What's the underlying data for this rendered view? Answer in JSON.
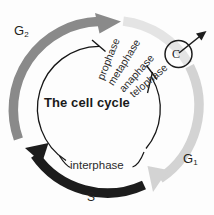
{
  "figure": {
    "title": "The cell cycle",
    "background_color": "#fdfdfd"
  },
  "center": {
    "title": "The cell cycle"
  },
  "phases": {
    "g2": {
      "label": "G",
      "subscript": "2",
      "full_name": "G2 phase",
      "color": "#8a8a8a"
    },
    "g1": {
      "label": "G",
      "subscript": "1",
      "full_name": "G1 phase",
      "color": "#d2d2d2"
    },
    "s": {
      "label": "S",
      "full_name": "S phase",
      "color": "#1c1c1c"
    },
    "m": {
      "label": "M",
      "full_name": "Mitosis",
      "color": "#e2e2e2"
    }
  },
  "inner_arc": {
    "label": "interphase"
  },
  "mitosis_stages": [
    {
      "label": "prophase"
    },
    {
      "label": "metaphase"
    },
    {
      "label": "anaphase"
    },
    {
      "label": "telophase"
    }
  ],
  "cytokinesis": {
    "label": "C",
    "full_name": "cytokinesis"
  },
  "colors": {
    "g2_arc": "#8a8a8a",
    "g1_arc": "#d2d2d2",
    "s_arc": "#1c1c1c",
    "m_arc": "#e2e2e2",
    "interphase_line": "#1a1a1a",
    "text": "#231f20"
  }
}
